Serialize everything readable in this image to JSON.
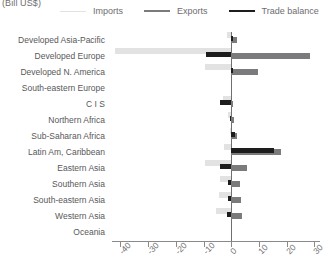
{
  "chart_data": {
    "type": "bar",
    "orientation": "horizontal",
    "title": "(Bill US$)",
    "xlabel": "",
    "ylabel": "",
    "xlim": [
      -43,
      32
    ],
    "xticks": [
      -40,
      -30,
      -20,
      -10,
      0,
      10,
      20,
      30
    ],
    "xtick_labels": [
      "-40",
      "-30",
      "-20",
      "-10",
      "0",
      "10",
      "20",
      "30"
    ],
    "grid": false,
    "legend_position": "top",
    "categories": [
      "Developed Asia-Pacific",
      "Developed Europe",
      "Developed N. America",
      "South-eastern Europe",
      "C I S",
      "Northern Africa",
      "Sub-Saharan Africa",
      "Latin Am, Caribbean",
      "Eastern Asia",
      "Southern Asia",
      "South-eastern Asia",
      "Western Asia",
      "Oceania"
    ],
    "series": [
      {
        "name": "Imports",
        "color": "#e2e2e2",
        "values": [
          -1.5,
          -42.0,
          -9.5,
          0.0,
          -3.0,
          -1.0,
          -0.5,
          -2.5,
          -9.5,
          -4.0,
          -4.5,
          -5.5,
          0.0
        ]
      },
      {
        "name": "Exports",
        "color": "#7b7b7d",
        "values": [
          2.0,
          28.5,
          9.5,
          0.0,
          0.5,
          1.0,
          2.0,
          18.0,
          5.5,
          3.0,
          3.5,
          4.0,
          0.0
        ]
      },
      {
        "name": "Trade balance",
        "color": "#1d1d1d",
        "values": [
          0.8,
          -9.0,
          0.8,
          0.0,
          -4.0,
          -0.5,
          1.5,
          15.5,
          -4.0,
          -1.0,
          -1.2,
          -1.5,
          0.0
        ]
      }
    ]
  },
  "legend": {
    "items": [
      {
        "label": "Imports"
      },
      {
        "label": "Exports"
      },
      {
        "label": "Trade balance"
      }
    ]
  }
}
